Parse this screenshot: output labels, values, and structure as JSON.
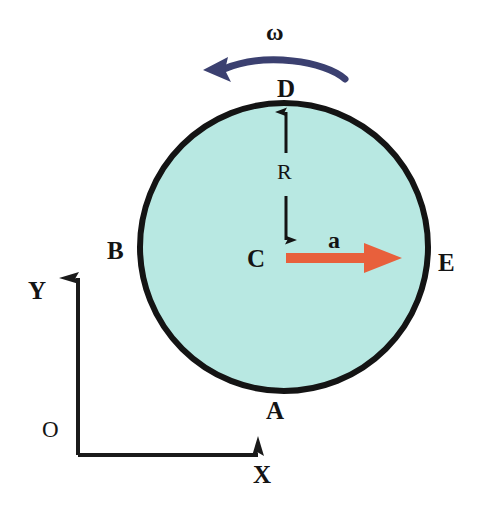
{
  "figure": {
    "background_color": "#ffffff",
    "width": 481,
    "height": 513
  },
  "disk": {
    "name": "rolling-disk",
    "center_x": 284,
    "center_y": 247,
    "radius": 147,
    "fill_color": "#B8E8E2",
    "stroke_color": "#141414",
    "stroke_width": 6
  },
  "points": {
    "top": "D",
    "bottom": "A",
    "left": "B",
    "right": "E",
    "center": "C"
  },
  "vectors": {
    "angular_velocity": {
      "label": "ω",
      "color": "#3B4070",
      "direction": "counterclockwise"
    },
    "acceleration": {
      "label": "a",
      "color": "#E8603C",
      "direction": "right"
    }
  },
  "dimension": {
    "radius_label": "R"
  },
  "axes": {
    "origin_label": "O",
    "x_label": "X",
    "y_label": "Y",
    "color": "#1A1A1A"
  }
}
